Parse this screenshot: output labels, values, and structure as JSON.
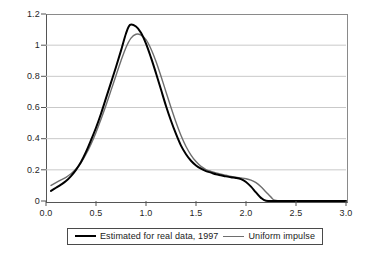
{
  "chart_data": {
    "type": "line",
    "title": "",
    "subtitle": "",
    "xlabel": "",
    "ylabel": "",
    "xlim": [
      0.0,
      3.0
    ],
    "ylim": [
      0.0,
      1.2
    ],
    "grid": "horizontal",
    "legend_position": "bottom",
    "x_ticks": [
      "0.0",
      "0.5",
      "1.0",
      "1.5",
      "2.0",
      "2.5",
      "3.0"
    ],
    "x_tick_values": [
      0.0,
      0.5,
      1.0,
      1.5,
      2.0,
      2.5,
      3.0
    ],
    "y_ticks": [
      "0",
      "0.2",
      "0.4",
      "0.6",
      "0.8",
      "1",
      "1.2"
    ],
    "y_tick_values": [
      0.0,
      0.2,
      0.4,
      0.6,
      0.8,
      1.0,
      1.2
    ],
    "series": [
      {
        "name": "Estimated for real data, 1997",
        "color": "#000000",
        "width": 2,
        "peak_x": 0.84,
        "peak_y": 1.13,
        "x": [
          0.05,
          0.1,
          0.15,
          0.2,
          0.25,
          0.3,
          0.35,
          0.4,
          0.45,
          0.5,
          0.55,
          0.6,
          0.65,
          0.7,
          0.75,
          0.8,
          0.84,
          0.9,
          0.95,
          1.0,
          1.05,
          1.1,
          1.15,
          1.2,
          1.25,
          1.3,
          1.35,
          1.4,
          1.45,
          1.5,
          1.55,
          1.6,
          1.65,
          1.7,
          1.75,
          1.8,
          1.85,
          1.9,
          1.95,
          2.0,
          2.05,
          2.1,
          2.15,
          2.2,
          2.3,
          2.5,
          3.0
        ],
        "y": [
          0.065,
          0.085,
          0.105,
          0.128,
          0.16,
          0.2,
          0.25,
          0.315,
          0.39,
          0.47,
          0.56,
          0.66,
          0.76,
          0.86,
          0.965,
          1.075,
          1.13,
          1.12,
          1.08,
          1.01,
          0.92,
          0.82,
          0.715,
          0.61,
          0.515,
          0.43,
          0.355,
          0.3,
          0.258,
          0.228,
          0.207,
          0.192,
          0.182,
          0.172,
          0.165,
          0.158,
          0.152,
          0.148,
          0.14,
          0.122,
          0.092,
          0.055,
          0.02,
          0.002,
          0.0,
          0.0,
          0.0
        ]
      },
      {
        "name": "Uniform impulse",
        "color": "#6e6e6e",
        "width": 1.4,
        "peak_x": 0.9,
        "peak_y": 1.07,
        "x": [
          0.05,
          0.1,
          0.15,
          0.2,
          0.25,
          0.3,
          0.35,
          0.4,
          0.45,
          0.5,
          0.55,
          0.6,
          0.65,
          0.7,
          0.75,
          0.8,
          0.85,
          0.9,
          0.95,
          1.0,
          1.05,
          1.1,
          1.15,
          1.2,
          1.25,
          1.3,
          1.35,
          1.4,
          1.45,
          1.5,
          1.55,
          1.6,
          1.65,
          1.7,
          1.75,
          1.8,
          1.85,
          1.9,
          1.95,
          2.0,
          2.05,
          2.1,
          2.15,
          2.2,
          2.25,
          2.3,
          2.5,
          3.0
        ],
        "y": [
          0.1,
          0.118,
          0.135,
          0.152,
          0.175,
          0.205,
          0.245,
          0.3,
          0.365,
          0.44,
          0.525,
          0.615,
          0.71,
          0.805,
          0.9,
          0.985,
          1.045,
          1.07,
          1.065,
          1.035,
          0.975,
          0.895,
          0.8,
          0.7,
          0.6,
          0.505,
          0.42,
          0.35,
          0.295,
          0.253,
          0.222,
          0.202,
          0.19,
          0.18,
          0.172,
          0.165,
          0.158,
          0.152,
          0.148,
          0.143,
          0.134,
          0.118,
          0.092,
          0.058,
          0.025,
          0.003,
          0.0,
          0.0
        ]
      }
    ],
    "legend_entries": [
      {
        "label": "Estimated for real data, 1997",
        "style": "thick-black"
      },
      {
        "label": "Uniform impulse",
        "style": "thin-gray"
      }
    ]
  },
  "axes": {
    "y_labels": [
      "1.2",
      "1",
      "0.8",
      "0.6",
      "0.4",
      "0.2",
      "0"
    ],
    "x_labels": [
      "0.0",
      "0.5",
      "1.0",
      "1.5",
      "2.0",
      "2.5",
      "3.0"
    ]
  },
  "legend": {
    "entry_1_label": "Estimated for real data, 1997",
    "entry_2_label": "Uniform impulse"
  }
}
